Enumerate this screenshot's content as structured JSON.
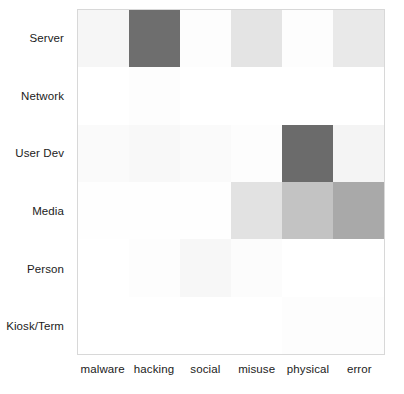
{
  "chart_data": {
    "type": "heatmap",
    "title": "",
    "xlabel": "",
    "ylabel": "",
    "x_categories": [
      "malware",
      "hacking",
      "social",
      "misuse",
      "physical",
      "error"
    ],
    "y_categories": [
      "Server",
      "Network",
      "User Dev",
      "Media",
      "Person",
      "Kiosk/Term"
    ],
    "grid": false,
    "legend": "none",
    "colormap": "greys",
    "value_range": [
      0,
      1
    ],
    "rows": [
      {
        "label": "Server",
        "values": [
          0.06,
          0.57,
          0.01,
          0.11,
          0.01,
          0.09
        ],
        "colors": [
          "#f6f6f6",
          "#6e6e6e",
          "#fdfdfd",
          "#e4e4e4",
          "#fdfdfd",
          "#e9e9e9"
        ]
      },
      {
        "label": "Network",
        "values": [
          0.0,
          0.01,
          0.0,
          0.0,
          0.0,
          0.0
        ],
        "colors": [
          "#ffffff",
          "#fdfdfd",
          "#ffffff",
          "#ffffff",
          "#ffffff",
          "#ffffff"
        ]
      },
      {
        "label": "User Dev",
        "values": [
          0.02,
          0.03,
          0.02,
          0.01,
          0.58,
          0.04
        ],
        "colors": [
          "#fafafa",
          "#f8f8f8",
          "#fafafa",
          "#fdfdfd",
          "#6b6b6b",
          "#f4f4f4"
        ]
      },
      {
        "label": "Media",
        "values": [
          0.01,
          0.01,
          0.01,
          0.12,
          0.25,
          0.38
        ],
        "colors": [
          "#fefefe",
          "#fefefe",
          "#fefefe",
          "#e2e2e2",
          "#c3c3c3",
          "#a9a9a9"
        ]
      },
      {
        "label": "Person",
        "values": [
          0.0,
          0.01,
          0.03,
          0.01,
          0.0,
          0.0
        ],
        "colors": [
          "#ffffff",
          "#fdfdfd",
          "#f7f7f7",
          "#fcfcfc",
          "#ffffff",
          "#ffffff"
        ]
      },
      {
        "label": "Kiosk/Term",
        "values": [
          0.0,
          0.0,
          0.0,
          0.0,
          0.01,
          0.01
        ],
        "colors": [
          "#ffffff",
          "#ffffff",
          "#ffffff",
          "#ffffff",
          "#fdfdfd",
          "#fdfdfd"
        ]
      }
    ]
  },
  "axes": {
    "x_labels": [
      "malware",
      "hacking",
      "social",
      "misuse",
      "physical",
      "error"
    ],
    "y_labels": [
      "Server",
      "Network",
      "User Dev",
      "Media",
      "Person",
      "Kiosk/Term"
    ]
  },
  "style": {
    "frame_color": "#d8d8d8",
    "text_color": "#1b1b1b",
    "background": "#ffffff"
  }
}
